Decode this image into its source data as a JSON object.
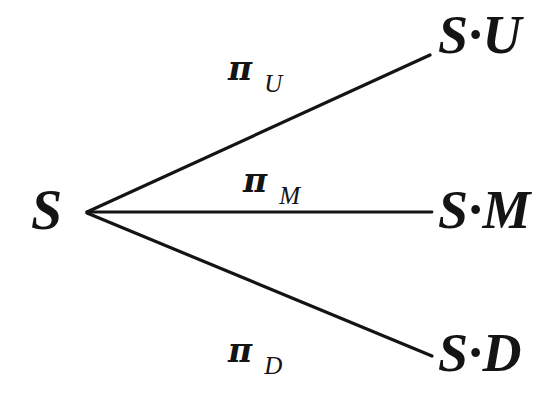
{
  "figure": {
    "type": "trinomial-tree-diagram",
    "background_color": "#ffffff",
    "ink_color": "#141414"
  },
  "nodes": {
    "root": {
      "id": "S",
      "label": "S",
      "x": 55,
      "y": 212
    },
    "leaves": [
      {
        "id": "SU",
        "label": "S·U",
        "x": 470,
        "y": 35,
        "branch": "up"
      },
      {
        "id": "SM",
        "label": "S·M",
        "x": 470,
        "y": 212,
        "branch": "middle"
      },
      {
        "id": "SD",
        "label": "S·D",
        "x": 470,
        "y": 355,
        "branch": "down"
      }
    ]
  },
  "edges": [
    {
      "id": "edge-up",
      "from": "S",
      "to": "SU",
      "pi": "π",
      "subscript": "U",
      "x1": 87,
      "y1": 212,
      "x2": 430,
      "y2": 55
    },
    {
      "id": "edge-mid",
      "from": "S",
      "to": "SM",
      "pi": "π",
      "subscript": "M",
      "x1": 87,
      "y1": 212,
      "x2": 432,
      "y2": 212
    },
    {
      "id": "edge-down",
      "from": "S",
      "to": "SD",
      "pi": "π",
      "subscript": "D",
      "x1": 87,
      "y1": 213,
      "x2": 432,
      "y2": 356
    }
  ]
}
